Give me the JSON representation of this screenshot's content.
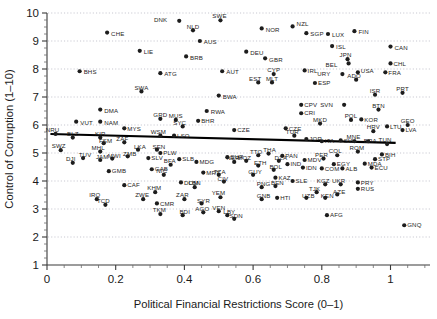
{
  "chart_data": {
    "type": "scatter",
    "title": "",
    "subtitle": "",
    "xlabel": "Political Financial Restrictions Score (0–1)",
    "ylabel": "Control of Corruption (1–10)",
    "xlim": [
      0,
      1.115
    ],
    "ylim": [
      1,
      10
    ],
    "xticks": [
      0,
      0.2,
      0.4,
      0.6,
      0.8,
      1
    ],
    "xtick_labels": [
      "0",
      "0.2",
      "0.4",
      "0.6",
      "0.8",
      "1"
    ],
    "yticks": [
      1,
      2,
      3,
      4,
      5,
      6,
      7,
      8,
      9,
      10
    ],
    "ytick_labels": [
      "1",
      "2",
      "3",
      "4",
      "5",
      "6",
      "7",
      "8",
      "9",
      "10"
    ],
    "grid": true,
    "grid_axis": "y",
    "grid_style": "dotted",
    "legend": null,
    "marker_color": "#1d1d1d",
    "marker_size": 2.1,
    "trendline": {
      "type": "linear-fit",
      "x0": 0.01,
      "y0": 5.68,
      "x1": 1.015,
      "y1": 5.36,
      "color": "#000000",
      "width": 2.1
    },
    "label_font_size": 6.1,
    "points": [
      {
        "label": "DNK",
        "x": 0.385,
        "y": 9.72,
        "lx": -12,
        "ly": -1
      },
      {
        "label": "SWE",
        "x": 0.505,
        "y": 9.74,
        "lx": -1,
        "ly": -4
      },
      {
        "label": "NZL",
        "x": 0.715,
        "y": 9.52,
        "lx": 4,
        "ly": -3
      },
      {
        "label": "NOR",
        "x": 0.625,
        "y": 9.45,
        "lx": 4,
        "ly": 1
      },
      {
        "label": "NLD",
        "x": 0.425,
        "y": 9.38,
        "lx": 0,
        "ly": -4
      },
      {
        "label": "CHE",
        "x": 0.175,
        "y": 9.3,
        "lx": 4,
        "ly": 1
      },
      {
        "label": "SGP",
        "x": 0.755,
        "y": 9.28,
        "lx": 4,
        "ly": 1
      },
      {
        "label": "LUX",
        "x": 0.818,
        "y": 9.25,
        "lx": 4,
        "ly": 1
      },
      {
        "label": "FIN",
        "x": 0.895,
        "y": 9.35,
        "lx": 4,
        "ly": 1
      },
      {
        "label": "AUS",
        "x": 0.445,
        "y": 9.0,
        "lx": 4,
        "ly": 1
      },
      {
        "label": "LIE",
        "x": 0.27,
        "y": 8.65,
        "lx": 4,
        "ly": 1
      },
      {
        "label": "DEU",
        "x": 0.58,
        "y": 8.62,
        "lx": 4,
        "ly": 1
      },
      {
        "label": "ISL",
        "x": 0.83,
        "y": 8.82,
        "lx": 4,
        "ly": 1
      },
      {
        "label": "CAN",
        "x": 1.0,
        "y": 8.8,
        "lx": 4,
        "ly": 1
      },
      {
        "label": "BRB",
        "x": 0.405,
        "y": 8.45,
        "lx": 4,
        "ly": 1
      },
      {
        "label": "GBR",
        "x": 0.635,
        "y": 8.38,
        "lx": 4,
        "ly": 1
      },
      {
        "label": "JPN",
        "x": 0.875,
        "y": 8.35,
        "lx": -2,
        "ly": -4
      },
      {
        "label": "BHS",
        "x": 0.095,
        "y": 7.92,
        "lx": 4,
        "ly": 1
      },
      {
        "label": "ATG",
        "x": 0.33,
        "y": 7.85,
        "lx": 4,
        "ly": 1
      },
      {
        "label": "AUT",
        "x": 0.51,
        "y": 7.92,
        "lx": 4,
        "ly": 1
      },
      {
        "label": "CYP",
        "x": 0.66,
        "y": 7.82,
        "lx": 0,
        "ly": -4
      },
      {
        "label": "IRL",
        "x": 0.75,
        "y": 7.95,
        "lx": 3,
        "ly": 0
      },
      {
        "label": "USA",
        "x": 0.905,
        "y": 7.88,
        "lx": 3,
        "ly": -2
      },
      {
        "label": "URY",
        "x": 0.86,
        "y": 7.82,
        "lx": -12,
        "ly": 0
      },
      {
        "label": "BEL",
        "x": 0.878,
        "y": 8.2,
        "lx": -11,
        "ly": 1
      },
      {
        "label": "CHL",
        "x": 1.0,
        "y": 8.2,
        "lx": 3,
        "ly": 0
      },
      {
        "label": "FRA",
        "x": 0.985,
        "y": 7.88,
        "lx": 3,
        "ly": 0
      },
      {
        "label": "EST",
        "x": 0.615,
        "y": 7.52,
        "lx": -3,
        "ly": -4
      },
      {
        "label": "MLT",
        "x": 0.655,
        "y": 7.52,
        "lx": 0,
        "ly": -4
      },
      {
        "label": "ESP",
        "x": 0.78,
        "y": 7.5,
        "lx": 3,
        "ly": 0
      },
      {
        "label": "ADO",
        "x": 0.9,
        "y": 7.62,
        "lx": -2,
        "ly": -4
      },
      {
        "label": "SWA",
        "x": 0.275,
        "y": 7.2,
        "lx": 0,
        "ly": -4
      },
      {
        "label": "BWA",
        "x": 0.5,
        "y": 7.05,
        "lx": 4,
        "ly": 1
      },
      {
        "label": "ISR",
        "x": 0.955,
        "y": 7.08,
        "lx": 0,
        "ly": -4
      },
      {
        "label": "PRT",
        "x": 1.035,
        "y": 7.15,
        "lx": 0,
        "ly": -4
      },
      {
        "label": "CPV",
        "x": 0.74,
        "y": 6.72,
        "lx": 3,
        "ly": 0
      },
      {
        "label": "SVN",
        "x": 0.865,
        "y": 6.72,
        "lx": -11,
        "ly": 0
      },
      {
        "label": "DMA",
        "x": 0.155,
        "y": 6.55,
        "lx": 4,
        "ly": 1
      },
      {
        "label": "RWA",
        "x": 0.465,
        "y": 6.5,
        "lx": 4,
        "ly": 1
      },
      {
        "label": "CRI",
        "x": 0.74,
        "y": 6.42,
        "lx": 3,
        "ly": 0
      },
      {
        "label": "BTN",
        "x": 0.965,
        "y": 6.55,
        "lx": 0,
        "ly": -4
      },
      {
        "label": "VUT",
        "x": 0.085,
        "y": 6.12,
        "lx": 4,
        "ly": 1
      },
      {
        "label": "NAM",
        "x": 0.155,
        "y": 6.12,
        "lx": 4,
        "ly": 1
      },
      {
        "label": "GRD",
        "x": 0.33,
        "y": 6.22,
        "lx": 0,
        "ly": -4
      },
      {
        "label": "MUS",
        "x": 0.375,
        "y": 6.18,
        "lx": 0,
        "ly": -4
      },
      {
        "label": "BHR",
        "x": 0.44,
        "y": 6.15,
        "lx": 3,
        "ly": 0
      },
      {
        "label": "POL",
        "x": 0.885,
        "y": 6.18,
        "lx": 0,
        "ly": -4
      },
      {
        "label": "KOR",
        "x": 0.915,
        "y": 6.2,
        "lx": 3,
        "ly": 0
      },
      {
        "label": "MKD",
        "x": 0.795,
        "y": 6.05,
        "lx": 0,
        "ly": -4
      },
      {
        "label": "HRV",
        "x": 0.95,
        "y": 5.78,
        "lx": 0,
        "ly": -4
      },
      {
        "label": "LTU",
        "x": 0.99,
        "y": 5.95,
        "lx": 3,
        "ly": 0
      },
      {
        "label": "GEO",
        "x": 1.05,
        "y": 6.0,
        "lx": 0,
        "ly": -4
      },
      {
        "label": "LVA",
        "x": 1.035,
        "y": 5.82,
        "lx": 3,
        "ly": 0
      },
      {
        "label": "MYS",
        "x": 0.225,
        "y": 5.88,
        "lx": 3,
        "ly": 0
      },
      {
        "label": "SYC",
        "x": 0.395,
        "y": 5.95,
        "lx": -3,
        "ly": -4
      },
      {
        "label": "CZE",
        "x": 0.695,
        "y": 5.88,
        "lx": 3,
        "ly": 0
      },
      {
        "label": "NRU",
        "x": 0.025,
        "y": 5.68,
        "lx": -3,
        "ly": -4
      },
      {
        "label": "BLZ",
        "x": 0.075,
        "y": 5.55,
        "lx": 0,
        "ly": -4
      },
      {
        "label": "KIR",
        "x": 0.155,
        "y": 5.55,
        "lx": 0,
        "ly": -4
      },
      {
        "label": "WSM",
        "x": 0.33,
        "y": 5.62,
        "lx": -2,
        "ly": -4
      },
      {
        "label": "LSO",
        "x": 0.37,
        "y": 5.62,
        "lx": 3,
        "ly": 0
      },
      {
        "label": "CZE2",
        "x": 0.545,
        "y": 5.82,
        "lx": 3,
        "ly": 0
      },
      {
        "label": "TUR",
        "x": 0.72,
        "y": 5.62,
        "lx": -2,
        "ly": -4
      },
      {
        "label": "JOR",
        "x": 0.755,
        "y": 5.5,
        "lx": 3,
        "ly": 0
      },
      {
        "label": "ITA",
        "x": 0.8,
        "y": 5.42,
        "lx": 3,
        "ly": 0
      },
      {
        "label": "SVK",
        "x": 0.855,
        "y": 5.45,
        "lx": 3,
        "ly": 0
      },
      {
        "label": "MNE",
        "x": 0.895,
        "y": 5.42,
        "lx": -1,
        "ly": -4
      },
      {
        "label": "BRA",
        "x": 0.935,
        "y": 5.42,
        "lx": 2,
        "ly": 0
      },
      {
        "label": "TUN",
        "x": 0.99,
        "y": 5.32,
        "lx": -2,
        "ly": -4
      },
      {
        "label": "SWZ",
        "x": 0.04,
        "y": 5.1,
        "lx": -2,
        "ly": -4
      },
      {
        "label": "FSM",
        "x": 0.165,
        "y": 5.35,
        "lx": 2,
        "ly": -2
      },
      {
        "label": "ZAF",
        "x": 0.225,
        "y": 5.38,
        "lx": -2,
        "ly": -4
      },
      {
        "label": "MHL",
        "x": 0.155,
        "y": 5.05,
        "lx": -2,
        "ly": -4
      },
      {
        "label": "LKA",
        "x": 0.265,
        "y": 5.12,
        "lx": 2,
        "ly": -3
      },
      {
        "label": "SEN",
        "x": 0.32,
        "y": 5.12,
        "lx": 2,
        "ly": -3
      },
      {
        "label": "TUV",
        "x": 0.105,
        "y": 4.82,
        "lx": 2,
        "ly": -3
      },
      {
        "label": "JAM",
        "x": 0.155,
        "y": 4.75,
        "lx": 2,
        "ly": -3
      },
      {
        "label": "MWI",
        "x": 0.19,
        "y": 4.8,
        "lx": 2,
        "ly": -3
      },
      {
        "label": "ZMB",
        "x": 0.235,
        "y": 4.88,
        "lx": 2,
        "ly": -3
      },
      {
        "label": "SLV",
        "x": 0.295,
        "y": 4.82,
        "lx": 3,
        "ly": 0
      },
      {
        "label": "PLW",
        "x": 0.33,
        "y": 5.0,
        "lx": 3,
        "ly": 0
      },
      {
        "label": "SLB",
        "x": 0.385,
        "y": 4.78,
        "lx": 3,
        "ly": 0
      },
      {
        "label": "SUR",
        "x": 0.525,
        "y": 4.85,
        "lx": 3,
        "ly": 0
      },
      {
        "label": "DJI",
        "x": 0.075,
        "y": 4.65,
        "lx": -2,
        "ly": -4
      },
      {
        "label": "GMB",
        "x": 0.18,
        "y": 4.35,
        "lx": 3,
        "ly": 0
      },
      {
        "label": "GAB",
        "x": 0.305,
        "y": 4.42,
        "lx": 3,
        "ly": 0
      },
      {
        "label": "BFA",
        "x": 0.36,
        "y": 4.58,
        "lx": -1,
        "ly": -4
      },
      {
        "label": "MDG",
        "x": 0.435,
        "y": 4.68,
        "lx": 3,
        "ly": 0
      },
      {
        "label": "NER",
        "x": 0.545,
        "y": 4.68,
        "lx": -1,
        "ly": -4
      },
      {
        "label": "NIC",
        "x": 0.34,
        "y": 4.22,
        "lx": -2,
        "ly": -4
      },
      {
        "label": "MRT",
        "x": 0.455,
        "y": 4.3,
        "lx": 3,
        "ly": 0
      },
      {
        "label": "TZA",
        "x": 0.5,
        "y": 4.22,
        "lx": 1,
        "ly": -3
      },
      {
        "label": "CAF",
        "x": 0.225,
        "y": 3.85,
        "lx": 3,
        "ly": 0
      },
      {
        "label": "DOM",
        "x": 0.39,
        "y": 3.95,
        "lx": 3,
        "ly": 0
      },
      {
        "label": "CIV",
        "x": 0.515,
        "y": 3.98,
        "lx": -1,
        "ly": -3
      },
      {
        "label": "KHM",
        "x": 0.315,
        "y": 3.6,
        "lx": -1,
        "ly": -4
      },
      {
        "label": "LBN",
        "x": 0.43,
        "y": 3.78,
        "lx": 0,
        "ly": -4
      },
      {
        "label": "IRQ",
        "x": 0.145,
        "y": 3.35,
        "lx": -2,
        "ly": -4
      },
      {
        "label": "ZWE",
        "x": 0.28,
        "y": 3.35,
        "lx": -1,
        "ly": -4
      },
      {
        "label": "TCD",
        "x": 0.17,
        "y": 3.15,
        "lx": -2,
        "ly": -4
      },
      {
        "label": "CMR",
        "x": 0.32,
        "y": 3.2,
        "lx": 3,
        "ly": 0
      },
      {
        "label": "ZAR",
        "x": 0.4,
        "y": 3.35,
        "lx": -2,
        "ly": -4
      },
      {
        "label": "SYR",
        "x": 0.45,
        "y": 3.2,
        "lx": 2,
        "ly": -3
      },
      {
        "label": "YEM",
        "x": 0.505,
        "y": 3.42,
        "lx": -2,
        "ly": -4
      },
      {
        "label": "TKM",
        "x": 0.33,
        "y": 2.82,
        "lx": -1,
        "ly": -4
      },
      {
        "label": "BDI",
        "x": 0.395,
        "y": 2.78,
        "lx": 2,
        "ly": -3
      },
      {
        "label": "AGO",
        "x": 0.455,
        "y": 2.88,
        "lx": -1,
        "ly": -4
      },
      {
        "label": "TTO",
        "x": 0.615,
        "y": 4.92,
        "lx": -2,
        "ly": -3
      },
      {
        "label": "THA",
        "x": 0.645,
        "y": 4.98,
        "lx": 1,
        "ly": -4
      },
      {
        "label": "PAN",
        "x": 0.685,
        "y": 4.9,
        "lx": 3,
        "ly": 0
      },
      {
        "label": "MOZ",
        "x": 0.58,
        "y": 4.72,
        "lx": -2,
        "ly": -3
      },
      {
        "label": "DZA",
        "x": 0.675,
        "y": 4.72,
        "lx": 2,
        "ly": -3
      },
      {
        "label": "IND",
        "x": 0.7,
        "y": 4.6,
        "lx": 3,
        "ly": 0
      },
      {
        "label": "ETH",
        "x": 0.615,
        "y": 4.55,
        "lx": 2,
        "ly": -3
      },
      {
        "label": "BOL",
        "x": 0.66,
        "y": 4.4,
        "lx": 2,
        "ly": -3
      },
      {
        "label": "GUY",
        "x": 0.6,
        "y": 4.22,
        "lx": 2,
        "ly": -3
      },
      {
        "label": "KAZ",
        "x": 0.665,
        "y": 4.12,
        "lx": 3,
        "ly": 0
      },
      {
        "label": "MDV",
        "x": 0.75,
        "y": 4.75,
        "lx": 3,
        "ly": 0
      },
      {
        "label": "PER",
        "x": 0.805,
        "y": 4.8,
        "lx": -2,
        "ly": -4
      },
      {
        "label": "COL",
        "x": 0.845,
        "y": 4.92,
        "lx": -2,
        "ly": -4
      },
      {
        "label": "ROM",
        "x": 0.905,
        "y": 5.05,
        "lx": -1,
        "ly": -4
      },
      {
        "label": "BIH",
        "x": 0.975,
        "y": 4.95,
        "lx": 3,
        "ly": 0
      },
      {
        "label": "STP",
        "x": 0.955,
        "y": 4.78,
        "lx": 3,
        "ly": 0
      },
      {
        "label": "EGY",
        "x": 0.835,
        "y": 4.6,
        "lx": 3,
        "ly": 0
      },
      {
        "label": "MDA",
        "x": 0.925,
        "y": 4.62,
        "lx": 3,
        "ly": 0
      },
      {
        "label": "ECU",
        "x": 0.945,
        "y": 4.48,
        "lx": 3,
        "ly": 0
      },
      {
        "label": "IDN",
        "x": 0.745,
        "y": 4.48,
        "lx": 3,
        "ly": 0
      },
      {
        "label": "COM",
        "x": 0.8,
        "y": 4.45,
        "lx": 3,
        "ly": 0
      },
      {
        "label": "ALB",
        "x": 0.86,
        "y": 4.45,
        "lx": 3,
        "ly": 0
      },
      {
        "label": "PNG",
        "x": 0.625,
        "y": 3.78,
        "lx": 2,
        "ly": -3
      },
      {
        "label": "BEN",
        "x": 0.665,
        "y": 3.82,
        "lx": 2,
        "ly": -3
      },
      {
        "label": "SLE",
        "x": 0.715,
        "y": 4.0,
        "lx": 3,
        "ly": 0
      },
      {
        "label": "KGZ",
        "x": 0.81,
        "y": 3.88,
        "lx": -2,
        "ly": -4
      },
      {
        "label": "UKR",
        "x": 0.855,
        "y": 3.88,
        "lx": -2,
        "ly": -4
      },
      {
        "label": "PRY",
        "x": 0.905,
        "y": 3.95,
        "lx": 3,
        "ly": 0
      },
      {
        "label": "RUS",
        "x": 0.905,
        "y": 3.72,
        "lx": 3,
        "ly": 0
      },
      {
        "label": "TJK",
        "x": 0.785,
        "y": 3.6,
        "lx": -2,
        "ly": -3
      },
      {
        "label": "GNB",
        "x": 0.625,
        "y": 3.35,
        "lx": 2,
        "ly": -3
      },
      {
        "label": "HTI",
        "x": 0.67,
        "y": 3.4,
        "lx": 3,
        "ly": 0
      },
      {
        "label": "UZB",
        "x": 0.755,
        "y": 3.4,
        "lx": 2,
        "ly": -2
      },
      {
        "label": "KEN",
        "x": 0.81,
        "y": 3.4,
        "lx": 2,
        "ly": -2
      },
      {
        "label": "AZE",
        "x": 0.845,
        "y": 3.52,
        "lx": 2,
        "ly": -3
      },
      {
        "label": "VEN",
        "x": 0.5,
        "y": 2.92,
        "lx": 0,
        "ly": -3
      },
      {
        "label": "LBY",
        "x": 0.525,
        "y": 2.78,
        "lx": 2,
        "ly": -3
      },
      {
        "label": "SDN",
        "x": 0.545,
        "y": 2.65,
        "lx": 2,
        "ly": -3
      },
      {
        "label": "AFG",
        "x": 0.815,
        "y": 2.78,
        "lx": 3,
        "ly": 0
      },
      {
        "label": "GNQ",
        "x": 1.04,
        "y": 2.42,
        "lx": 3,
        "ly": 0
      }
    ]
  }
}
